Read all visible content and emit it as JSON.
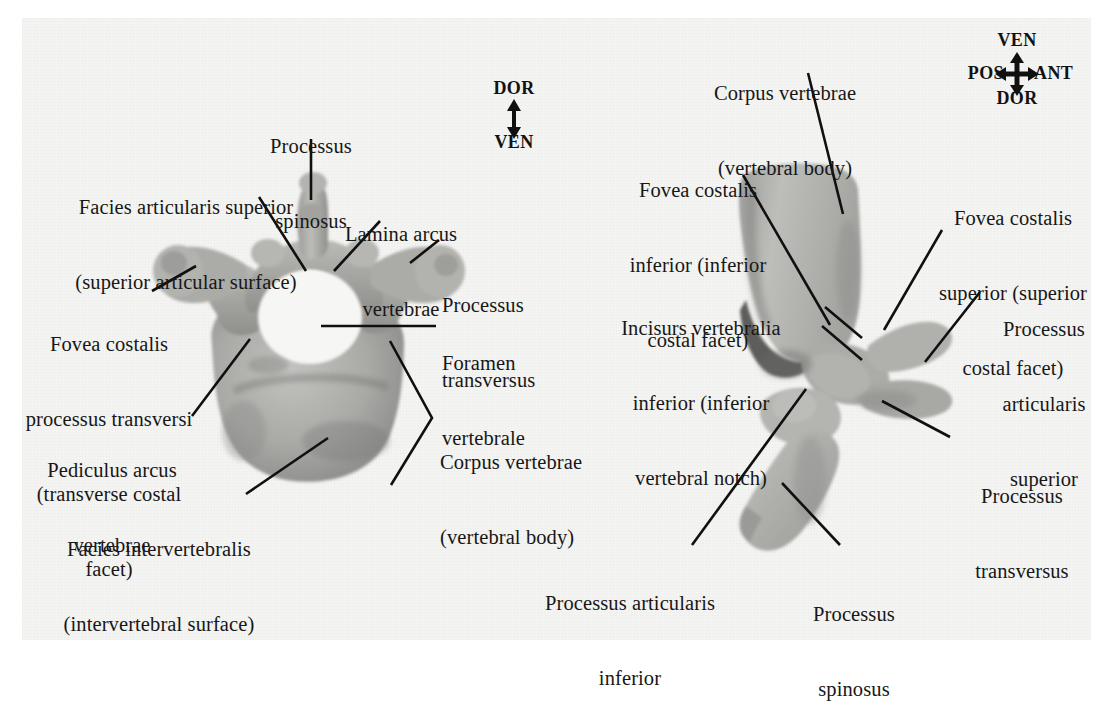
{
  "figure": {
    "background_color": "#f4f4f2",
    "bone_color": "#a9a9a7",
    "line_color": "#101010"
  },
  "left_view": {
    "name": "cranial-view",
    "compass": {
      "name": "dorsal-ventral-compass",
      "type": "vertical-double-arrow",
      "top": "DOR",
      "bottom": "VEN"
    },
    "labels": [
      {
        "id": "processus-spinosus",
        "lines": [
          "Processus",
          "spinosus"
        ]
      },
      {
        "id": "facies-articularis-superior",
        "lines": [
          "Facies articularis superior",
          "(superior articular surface)"
        ]
      },
      {
        "id": "lamina-arcus-vertebrae",
        "lines": [
          "Lamina arcus",
          "vertebrae"
        ]
      },
      {
        "id": "processus-transversus",
        "lines": [
          "Processus",
          "transversus"
        ]
      },
      {
        "id": "fovea-costalis-processus-transversi",
        "lines": [
          "Fovea costalis",
          "processus transversi",
          "(transverse costal",
          "facet)"
        ]
      },
      {
        "id": "foramen-vertebrale",
        "lines": [
          "Foramen",
          "vertebrale"
        ]
      },
      {
        "id": "pediculus-arcus-vertebrae",
        "lines": [
          "Pediculus arcus",
          "vertebrae"
        ]
      },
      {
        "id": "corpus-vertebrae",
        "lines": [
          "Corpus vertebrae",
          "(vertebral body)"
        ]
      },
      {
        "id": "facies-intervertebralis",
        "lines": [
          "Facies intervertebralis",
          "(intervertebral surface)"
        ]
      }
    ]
  },
  "right_view": {
    "name": "lateral-view",
    "compass": {
      "name": "four-way-orientation-compass",
      "type": "four-way-arrow",
      "top": "VEN",
      "bottom": "DOR",
      "left": "POS",
      "right": "ANT"
    },
    "labels": [
      {
        "id": "corpus-vertebrae",
        "lines": [
          "Corpus vertebrae",
          "(vertebral body)"
        ]
      },
      {
        "id": "fovea-costalis-inferior",
        "lines": [
          "Fovea costalis",
          "inferior (inferior",
          "costal facet)"
        ]
      },
      {
        "id": "fovea-costalis-superior",
        "lines": [
          "Fovea costalis",
          "superior (superior",
          "costal facet)"
        ]
      },
      {
        "id": "incisurs-vertebralia-inferior",
        "lines": [
          "Incisurs vertebralia",
          "inferior (inferior",
          "vertebral notch)"
        ]
      },
      {
        "id": "processus-articularis-superior",
        "lines": [
          "Processus",
          "articularis",
          "superior"
        ]
      },
      {
        "id": "processus-transversus",
        "lines": [
          "Processus",
          "transversus"
        ]
      },
      {
        "id": "processus-articularis-inferior",
        "lines": [
          "Processus articularis",
          "inferior"
        ]
      },
      {
        "id": "processus-spinosus",
        "lines": [
          "Processus",
          "spinosus"
        ]
      }
    ]
  }
}
